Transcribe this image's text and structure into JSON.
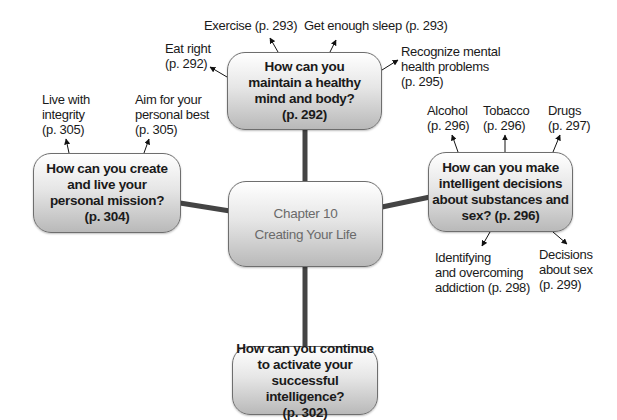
{
  "diagram": {
    "center": {
      "line1": "Chapter 10",
      "line2": "Creating Your Life"
    },
    "nodes": {
      "top": {
        "text": "How can you\nmaintain a healthy\nmind and body?\n(p. 292)"
      },
      "left": {
        "text": "How can you create\nand live your\npersonal mission?\n(p. 304)"
      },
      "right": {
        "text": "How can you make\nintelligent decisions\nabout substances and\nsex? (p. 296)"
      },
      "bottom": {
        "text": "How can you continue\nto activate your\nsuccessful intelligence?\n(p. 302)"
      }
    },
    "leaves": {
      "eat_right": "Eat right\n(p. 292)",
      "exercise": "Exercise (p. 293)",
      "sleep": "Get enough sleep (p. 293)",
      "mental_health": "Recognize mental\nhealth problems\n(p. 295)",
      "integrity": "Live with\nintegrity\n(p. 305)",
      "personal_best": "Aim for your\npersonal best\n(p. 305)",
      "alcohol": "Alcohol\n(p. 296)",
      "tobacco": "Tobacco\n(p. 296)",
      "drugs": "Drugs\n(p. 297)",
      "addiction": "Identifying\nand overcoming\naddiction (p. 298)",
      "sex": "Decisions\nabout sex\n(p. 299)"
    },
    "colors": {
      "connector": "#444444",
      "border": "#6e6e6e",
      "center_text": "#6a6a6a"
    }
  }
}
